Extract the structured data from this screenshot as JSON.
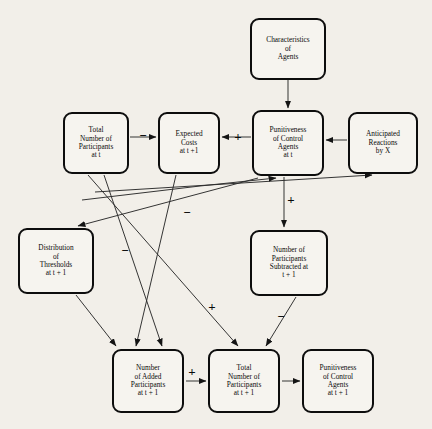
{
  "diagram": {
    "background_color": "#f2efe9",
    "box_border_color": "#0d0d0d",
    "line_color": "#2a2a2a",
    "nodes": [
      {
        "id": "characteristics",
        "lines": [
          "Characteristics",
          "of",
          "Agents"
        ],
        "x": 250,
        "y": 18,
        "w": 76,
        "h": 62,
        "font_size": 7.3
      },
      {
        "id": "total_participants_t",
        "lines": [
          "Total",
          "Number of",
          "Participants",
          "at t"
        ],
        "x": 63,
        "y": 112,
        "w": 66,
        "h": 62,
        "font_size": 7.3
      },
      {
        "id": "expected_costs",
        "lines": [
          "Expected",
          "Costs",
          "at t +1"
        ],
        "x": 158,
        "y": 112,
        "w": 62,
        "h": 62,
        "font_size": 7.3
      },
      {
        "id": "punitiveness_t",
        "lines": [
          "Punitiveness",
          "of Control",
          "Agents",
          "at t"
        ],
        "x": 252,
        "y": 110,
        "w": 72,
        "h": 66,
        "font_size": 7.3
      },
      {
        "id": "anticipated_reactions",
        "lines": [
          "Anticipated",
          "Reactions",
          "by X"
        ],
        "x": 348,
        "y": 112,
        "w": 70,
        "h": 62,
        "font_size": 7.3
      },
      {
        "id": "distribution_thresholds",
        "lines": [
          "Distribution",
          "of",
          "Thresholds",
          "at t + 1"
        ],
        "x": 18,
        "y": 228,
        "w": 76,
        "h": 66,
        "font_size": 7.3
      },
      {
        "id": "participants_subtracted",
        "lines": [
          "Number of",
          "Participants",
          "Subtracted at",
          "t + 1"
        ],
        "x": 250,
        "y": 230,
        "w": 78,
        "h": 66,
        "font_size": 7.3
      },
      {
        "id": "added_participants",
        "lines": [
          "Number",
          "of Added",
          "Participants",
          "at t + 1"
        ],
        "x": 112,
        "y": 349,
        "w": 72,
        "h": 64,
        "font_size": 7.3
      },
      {
        "id": "total_participants_t1",
        "lines": [
          "Total",
          "Number of",
          "Participants",
          "at t + 1"
        ],
        "x": 208,
        "y": 349,
        "w": 72,
        "h": 64,
        "font_size": 7.3
      },
      {
        "id": "punitiveness_t1",
        "lines": [
          "Punitiveness",
          "of Control",
          "Agents",
          "at t + 1"
        ],
        "x": 302,
        "y": 349,
        "w": 72,
        "h": 64,
        "font_size": 7.3
      }
    ],
    "edges": [
      {
        "id": "characteristics-to-punitiveness",
        "from": "characteristics",
        "to": "punitiveness_t",
        "sign": ""
      },
      {
        "id": "total-participants-to-expected-costs",
        "from": "total_participants_t",
        "to": "expected_costs",
        "sign": "−"
      },
      {
        "id": "punitiveness-to-expected-costs",
        "from": "punitiveness_t",
        "to": "expected_costs",
        "sign": "+"
      },
      {
        "id": "anticipated-reactions-to-punitiveness",
        "from": "anticipated_reactions",
        "to": "punitiveness_t",
        "sign": ""
      },
      {
        "id": "punitiveness-to-subtracted",
        "from": "punitiveness_t",
        "to": "participants_subtracted",
        "sign": "+"
      },
      {
        "id": "punitiveness-to-distribution",
        "from": "punitiveness_t",
        "to": "distribution_thresholds",
        "sign": ""
      },
      {
        "id": "total-participants-to-anticipated",
        "from": "total_participants_t",
        "to": "anticipated_reactions",
        "sign": ""
      },
      {
        "id": "total-participants-to-punitiveness",
        "from": "total_participants_t",
        "to": "punitiveness_t",
        "sign": ""
      },
      {
        "id": "total-participants-to-added",
        "from": "total_participants_t",
        "to": "added_participants",
        "sign": "−"
      },
      {
        "id": "total-participants-to-total-t1",
        "from": "total_participants_t",
        "to": "total_participants_t1",
        "sign": "+"
      },
      {
        "id": "expected-costs-to-added",
        "from": "expected_costs",
        "to": "added_participants",
        "sign": "−"
      },
      {
        "id": "distribution-to-added",
        "from": "distribution_thresholds",
        "to": "added_participants",
        "sign": ""
      },
      {
        "id": "subtracted-to-total-t1",
        "from": "participants_subtracted",
        "to": "total_participants_t1",
        "sign": "−"
      },
      {
        "id": "added-to-total-t1",
        "from": "added_participants",
        "to": "total_participants_t1",
        "sign": "+"
      },
      {
        "id": "total-t1-to-punitiveness-t1",
        "from": "total_participants_t1",
        "to": "punitiveness_t1",
        "sign": ""
      }
    ],
    "signs": [
      {
        "id": "sign-total-to-expected",
        "text": "−",
        "x": 143,
        "y": 135,
        "size": 13
      },
      {
        "id": "sign-punitiveness-to-expected",
        "text": "+",
        "x": 238,
        "y": 136,
        "size": 13
      },
      {
        "id": "sign-punitiveness-to-subtracted",
        "text": "+",
        "x": 291,
        "y": 199,
        "size": 13
      },
      {
        "id": "sign-total-to-added",
        "text": "−",
        "x": 187,
        "y": 212,
        "size": 13
      },
      {
        "id": "sign-expected-to-added",
        "text": "−",
        "x": 125,
        "y": 250,
        "size": 13
      },
      {
        "id": "sign-total-to-total-t1",
        "text": "+",
        "x": 212,
        "y": 306,
        "size": 13
      },
      {
        "id": "sign-subtracted-to-total-t1",
        "text": "−",
        "x": 281,
        "y": 316,
        "size": 13
      },
      {
        "id": "sign-added-to-total-t1",
        "text": "+",
        "x": 192,
        "y": 371,
        "size": 13
      }
    ]
  }
}
